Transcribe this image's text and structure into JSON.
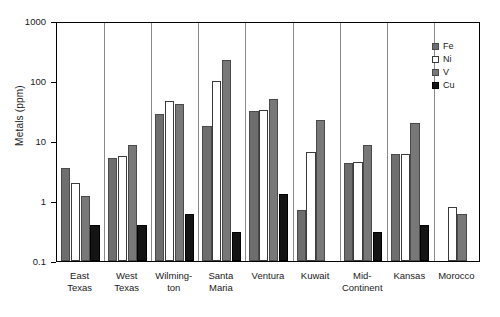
{
  "chart_data": {
    "type": "bar",
    "title": "",
    "xlabel": "",
    "ylabel": "Metals (ppm)",
    "yscale": "log",
    "ylim": [
      0.1,
      1000
    ],
    "ytick_labels": [
      "1000",
      "100",
      "10",
      "1",
      "0.1"
    ],
    "ytick_values": [
      1000,
      100,
      10,
      1,
      0.1
    ],
    "grid": false,
    "legend_position": "top-right",
    "categories": [
      "East Texas",
      "West Texas",
      "Wilmington",
      "Santa Maria",
      "Ventura",
      "Kuwait",
      "Mid-Continent",
      "Kansas",
      "Morocco"
    ],
    "category_lines": [
      [
        "East",
        "Texas"
      ],
      [
        "West",
        "Texas"
      ],
      [
        "Wilming-",
        "ton"
      ],
      [
        "Santa",
        "Maria"
      ],
      [
        "Ventura",
        ""
      ],
      [
        "Kuwait",
        ""
      ],
      [
        "Mid-",
        "Continent"
      ],
      [
        "Kansas",
        ""
      ],
      [
        "Morocco",
        ""
      ]
    ],
    "series": [
      {
        "name": "Fe",
        "color": "#6e6e6e",
        "values": [
          3.5,
          5.2,
          28,
          18,
          32,
          0.7,
          4.3,
          6.0,
          null
        ]
      },
      {
        "name": "Ni",
        "color": "#ffffff",
        "values": [
          2.0,
          5.6,
          47,
          100,
          33,
          6.5,
          4.5,
          6.0,
          0.8
        ]
      },
      {
        "name": "V",
        "color": "#787878",
        "values": [
          1.2,
          8.5,
          42,
          220,
          50,
          22,
          8.5,
          20,
          0.6
        ]
      },
      {
        "name": "Cu",
        "color": "#141414",
        "values": [
          0.4,
          0.4,
          0.6,
          0.3,
          1.3,
          null,
          0.3,
          0.4,
          null
        ]
      }
    ]
  },
  "legend": {
    "items": [
      {
        "label": "Fe",
        "key": "fe"
      },
      {
        "label": "Ni",
        "key": "ni"
      },
      {
        "label": "V",
        "key": "v"
      },
      {
        "label": "Cu",
        "key": "cu"
      }
    ]
  },
  "axis": {
    "y_title": "Metals (ppm)"
  }
}
